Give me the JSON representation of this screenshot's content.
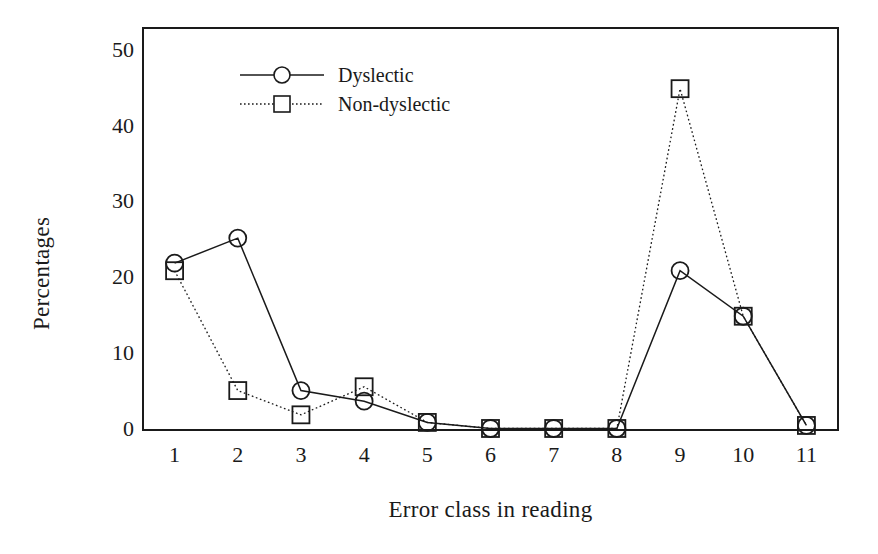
{
  "chart_data": {
    "type": "line",
    "title": "",
    "xlabel": "Error class in reading",
    "ylabel": "Percentages",
    "categories": [
      "1",
      "2",
      "3",
      "4",
      "5",
      "6",
      "7",
      "8",
      "9",
      "10",
      "11"
    ],
    "x": [
      1,
      2,
      3,
      4,
      5,
      6,
      7,
      8,
      9,
      10,
      11
    ],
    "xlim": [
      0.5,
      11.5
    ],
    "ylim": [
      0,
      53
    ],
    "yticks": [
      0,
      10,
      20,
      30,
      40,
      50
    ],
    "ytick_labels": [
      "0",
      "10",
      "20",
      "30",
      "40",
      "50"
    ],
    "grid": false,
    "legend_position": "top-center",
    "series": [
      {
        "name": "Dyslectic",
        "marker": "circle",
        "linestyle": "solid",
        "color": "#1a1a1a",
        "values": [
          22,
          25.3,
          5.2,
          3.8,
          1,
          0.2,
          0.2,
          0.2,
          21,
          15,
          0.6
        ]
      },
      {
        "name": "Non-dyslectic",
        "marker": "square",
        "linestyle": "dotted",
        "color": "#1a1a1a",
        "values": [
          21,
          5.2,
          2,
          5.7,
          1,
          0.2,
          0.2,
          0.2,
          45,
          15,
          0.6
        ]
      }
    ]
  },
  "axes": {
    "y_title": "Percentages",
    "x_title": "Error class in reading",
    "frame_color": "#1a1a1a"
  },
  "legend": {
    "items": [
      {
        "label": "Dyslectic",
        "marker": "circle-marker",
        "line": "solid-line"
      },
      {
        "label": "Non-dyslectic",
        "marker": "square-marker",
        "line": "dotted-line"
      }
    ]
  }
}
